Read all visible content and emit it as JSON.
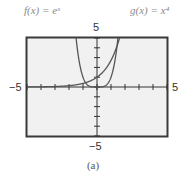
{
  "labels": {
    "f": "f(x) = eˣ",
    "g": "g(x) = x⁴",
    "caption": "(a)"
  },
  "axes": {
    "y_max_label": "5",
    "y_min_label": "−5",
    "x_min_label": "−5",
    "x_max_label": "5"
  },
  "chart_data": {
    "type": "line",
    "title": "",
    "xlabel": "",
    "ylabel": "",
    "xlim": [
      -5,
      5
    ],
    "ylim": [
      -5,
      5
    ],
    "xticks": [
      -5,
      -4,
      -3,
      -2,
      -1,
      0,
      1,
      2,
      3,
      4,
      5
    ],
    "yticks": [
      -5,
      -4,
      -3,
      -2,
      -1,
      0,
      1,
      2,
      3,
      4,
      5
    ],
    "grid": false,
    "series": [
      {
        "name": "f(x) = e^x",
        "function": "e^x",
        "x": [
          -5,
          -4,
          -3,
          -2,
          -1,
          0,
          1,
          1.6
        ],
        "values": [
          0.0067,
          0.018,
          0.05,
          0.135,
          0.368,
          1,
          2.718,
          4.95
        ]
      },
      {
        "name": "g(x) = x^4",
        "function": "x^4",
        "x": [
          -1.49,
          -1.2,
          -1,
          -0.5,
          0,
          0.5,
          1,
          1.2,
          1.49
        ],
        "values": [
          4.93,
          2.07,
          1,
          0.0625,
          0,
          0.0625,
          1,
          2.07,
          4.93
        ]
      }
    ],
    "caption": "(a)"
  },
  "colors": {
    "frame": "#3a3a3a",
    "plot_bg": "#f1f1f1",
    "curve": "#555555",
    "axis": "#333333"
  }
}
